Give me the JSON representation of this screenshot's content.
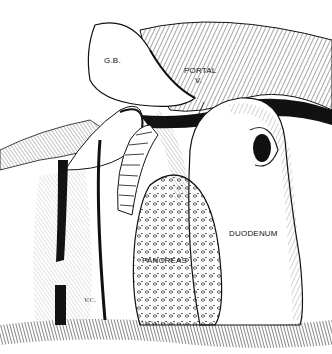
{
  "figure": {
    "type": "anatomical illustration",
    "style": "black ink pen hatching"
  },
  "labels": {
    "gallbladder": "G.B.",
    "portal_line1": "PORTAL",
    "portal_line2": "V.",
    "duodenum": "DUODENUM",
    "pancreas": "PANCREAS",
    "vc": "V.C."
  },
  "colors": {
    "ink": "#111111",
    "background": "#ffffff"
  }
}
